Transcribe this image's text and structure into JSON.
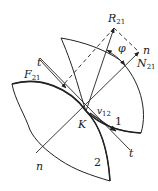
{
  "diagram": {
    "labels": {
      "R": {
        "base": "R",
        "sub": "21"
      },
      "N": {
        "base": "N",
        "sub": "21"
      },
      "F": {
        "base": "F",
        "sub": "21"
      },
      "v": {
        "base": "v",
        "sub": "12"
      },
      "phi": "φ",
      "n_top": "n",
      "n_bottom": "n",
      "t_top": "t",
      "t_bottom": "t",
      "K": "K",
      "body1": "1",
      "body2": "2"
    },
    "colors": {
      "stroke": "#222222",
      "background": "#ffffff"
    }
  }
}
